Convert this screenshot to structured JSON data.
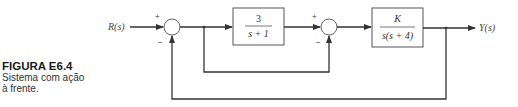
{
  "caption": {
    "title": "FIGURA E6.4",
    "line1": "Sistema com ação",
    "line2": "à frente."
  },
  "diagram": {
    "input_label": "R(s)",
    "output_label": "Y(s)",
    "block1": {
      "numerator": "3",
      "denominator": "s + 1"
    },
    "block2": {
      "numerator": "K",
      "denominator": "s(s + 4)"
    },
    "sum1": {
      "plus": "+",
      "minus": "−"
    },
    "sum2": {
      "plus": "+",
      "minus": "−"
    },
    "line_color": "#333333"
  }
}
